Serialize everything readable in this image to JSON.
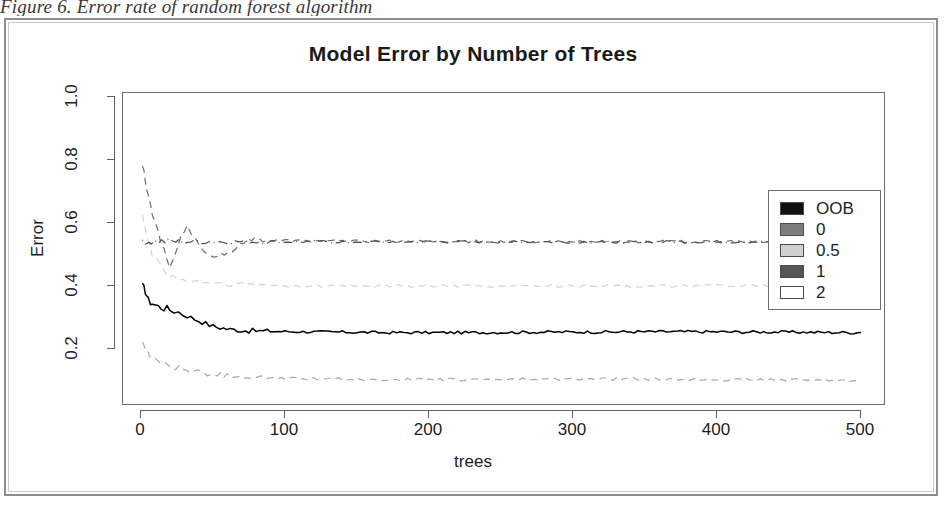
{
  "caption": "Figure 6. Error rate of random forest algorithm",
  "chart_data": {
    "type": "line",
    "title": "Model Error by Number of Trees",
    "xlabel": "trees",
    "ylabel": "Error",
    "xlim": [
      0,
      500
    ],
    "ylim": [
      0.06,
      1.04
    ],
    "xticks": [
      0,
      100,
      200,
      300,
      400,
      500
    ],
    "xtick_labels": [
      "0",
      "100",
      "200",
      "300",
      "400",
      "500"
    ],
    "yticks": [
      0.2,
      0.4,
      0.6,
      0.8,
      1.0
    ],
    "ytick_labels": [
      "0.2",
      "0.4",
      "0.6",
      "0.8",
      "1.0"
    ],
    "grid": false,
    "legend_position": "right-inside",
    "series": [
      {
        "name": "OOB",
        "color": "#000000",
        "style": "solid",
        "x": [
          1,
          3,
          5,
          8,
          12,
          16,
          20,
          26,
          32,
          40,
          50,
          62,
          75,
          90,
          110,
          130,
          150,
          175,
          200,
          230,
          260,
          290,
          320,
          350,
          380,
          410,
          440,
          470,
          500
        ],
        "values": [
          0.4,
          0.385,
          0.355,
          0.345,
          0.335,
          0.33,
          0.325,
          0.318,
          0.305,
          0.29,
          0.272,
          0.262,
          0.258,
          0.256,
          0.255,
          0.254,
          0.253,
          0.252,
          0.252,
          0.252,
          0.253,
          0.254,
          0.254,
          0.255,
          0.255,
          0.254,
          0.254,
          0.253,
          0.252
        ]
      },
      {
        "name": "0",
        "color": "#6e6e6e",
        "style": "dashed",
        "x": [
          1,
          3,
          5,
          8,
          12,
          16,
          20,
          24,
          28,
          32,
          38,
          44,
          50,
          58,
          66,
          74,
          82,
          95,
          120,
          160,
          200,
          250,
          300,
          360,
          420,
          470,
          500
        ],
        "values": [
          0.79,
          0.74,
          0.69,
          0.63,
          0.575,
          0.51,
          0.47,
          0.505,
          0.555,
          0.585,
          0.545,
          0.5,
          0.495,
          0.505,
          0.52,
          0.545,
          0.548,
          0.545,
          0.543,
          0.542,
          0.542,
          0.541,
          0.541,
          0.541,
          0.54,
          0.54,
          0.54
        ]
      },
      {
        "name": "0.5",
        "color": "#d2d2d2",
        "style": "dashed",
        "x": [
          1,
          4,
          8,
          14,
          22,
          32,
          45,
          60,
          80,
          110,
          150,
          200,
          260,
          320,
          380,
          440,
          500
        ],
        "values": [
          0.63,
          0.56,
          0.5,
          0.455,
          0.425,
          0.415,
          0.41,
          0.405,
          0.402,
          0.4,
          0.4,
          0.4,
          0.4,
          0.4,
          0.4,
          0.4,
          0.4
        ]
      },
      {
        "name": "1",
        "color": "#4f4f4f",
        "style": "dotdash",
        "x": [
          1,
          5,
          12,
          24,
          40,
          70,
          120,
          200,
          300,
          400,
          500
        ],
        "values": [
          0.545,
          0.54,
          0.54,
          0.54,
          0.54,
          0.54,
          0.54,
          0.54,
          0.54,
          0.54,
          0.54
        ]
      },
      {
        "name": "2",
        "color": "#a8a8a8",
        "style": "dashed",
        "x": [
          1,
          3,
          6,
          10,
          16,
          24,
          34,
          46,
          60,
          80,
          105,
          135,
          170,
          210,
          260,
          310,
          360,
          410,
          460,
          500
        ],
        "values": [
          0.215,
          0.195,
          0.18,
          0.168,
          0.155,
          0.142,
          0.13,
          0.122,
          0.116,
          0.11,
          0.106,
          0.104,
          0.103,
          0.103,
          0.104,
          0.105,
          0.104,
          0.103,
          0.102,
          0.1
        ]
      }
    ],
    "legend": [
      {
        "label": "OOB",
        "swatch": "#111111"
      },
      {
        "label": "0",
        "swatch": "#7d7d7d"
      },
      {
        "label": "0.5",
        "swatch": "#cfcfcf"
      },
      {
        "label": "1",
        "swatch": "#565656"
      },
      {
        "label": "2",
        "swatch": "#ffffff"
      }
    ]
  }
}
